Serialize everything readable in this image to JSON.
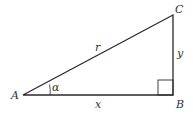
{
  "diagram": {
    "vertices": {
      "A": {
        "label": "A"
      },
      "B": {
        "label": "B"
      },
      "C": {
        "label": "C"
      }
    },
    "sides": {
      "hypotenuse": {
        "label": "r"
      },
      "adjacent": {
        "label": "x"
      },
      "opposite": {
        "label": "y"
      }
    },
    "angle": {
      "label": "α"
    },
    "colors": {
      "stroke": "#2a2a2a",
      "text": "#333333",
      "background": "#ffffff"
    }
  }
}
